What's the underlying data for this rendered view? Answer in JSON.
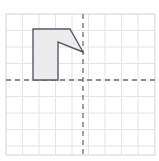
{
  "figure": {
    "title": "",
    "type": "coordinate-grid-polygon",
    "width": 159,
    "height": 161,
    "background_color": "#ffffff"
  },
  "grid": {
    "label": "square grid",
    "cell_size": 16.5,
    "x_start": 6.0,
    "y_start": 14.0,
    "columns": 9,
    "rows": 9,
    "line_color": "#e4e4e8",
    "line_width": 1,
    "visible": true,
    "outer_border_color": "#e0e0e6"
  },
  "axes": {
    "label": "dashed coordinate axes",
    "origin_x": 83,
    "origin_y": 80,
    "color": "#6b6b78",
    "line_width": 1.3,
    "dash_pattern": "5,4",
    "x_axis": {
      "name": "x-axis",
      "x1": 6,
      "y1": 80,
      "x2": 155,
      "y2": 80
    },
    "y_axis": {
      "name": "y-axis",
      "x1": 83,
      "y1": 14,
      "x2": 83,
      "y2": 155
    }
  },
  "shape": {
    "name": "notched-polygon",
    "fill_color": "#ececec",
    "stroke_color": "#5a5a66",
    "stroke_width": 1.4,
    "vertices": [
      {
        "x": 33,
        "y": 29
      },
      {
        "x": 70,
        "y": 29
      },
      {
        "x": 83,
        "y": 52
      },
      {
        "x": 58,
        "y": 42
      },
      {
        "x": 58,
        "y": 80
      },
      {
        "x": 33,
        "y": 80
      }
    ],
    "points_string": "33,29 70,29 83,52 58,42 58,80 33,80"
  }
}
